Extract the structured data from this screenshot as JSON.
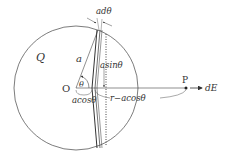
{
  "diagram": {
    "labels": {
      "charge": "Q",
      "origin": "O",
      "radius": "a",
      "angle": "θ",
      "arc_width": "adθ",
      "ring_radius": "asinθ",
      "ring_offset": "acosθ",
      "distance": "r−acosθ",
      "point": "P",
      "field": "dE"
    },
    "colors": {
      "stroke": "#333333",
      "background": "#ffffff"
    }
  }
}
